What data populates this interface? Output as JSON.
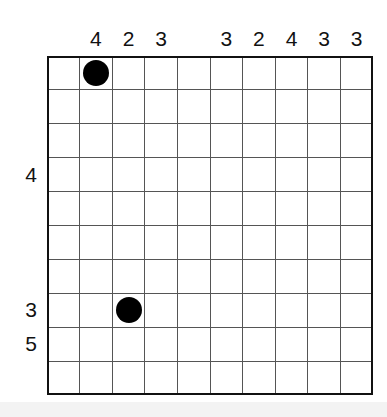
{
  "puzzle": {
    "columns": 10,
    "rows": 10,
    "column_clues": [
      "",
      "4",
      "2",
      "3",
      "",
      "3",
      "2",
      "4",
      "3",
      "3"
    ],
    "row_clues": [
      "",
      "",
      "",
      "4",
      "",
      "",
      "",
      "3",
      "5",
      ""
    ],
    "dots": [
      {
        "row": 1,
        "col": 2
      },
      {
        "row": 8,
        "col": 3
      }
    ],
    "colors": {
      "grid_line": "#555555",
      "border": "#111111",
      "dot": "#000000",
      "text": "#111111"
    }
  }
}
